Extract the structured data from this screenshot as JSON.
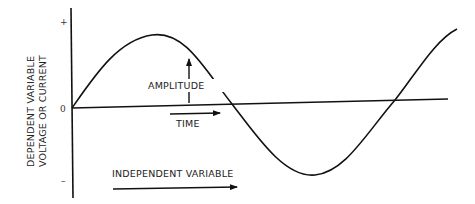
{
  "diagram": {
    "type": "sine-wave-diagram",
    "y_axis": {
      "label_line1": "DEPENDENT VARIABLE",
      "label_line2": "VOLTAGE OR CURRENT",
      "tick_plus": "+",
      "tick_zero": "0",
      "tick_minus": "–"
    },
    "annotations": {
      "amplitude": "AMPLITUDE",
      "time": "TIME",
      "independent_variable": "INDEPENDENT VARIABLE"
    },
    "colors": {
      "line": "#111111",
      "background": "#ffffff"
    }
  }
}
